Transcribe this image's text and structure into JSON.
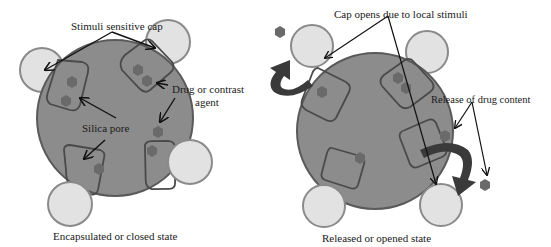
{
  "diagram": {
    "colors": {
      "sphere_fill": "#8c8c8c",
      "sphere_stroke": "#5a5a5a",
      "cap_fill": "#e2e2e2",
      "cap_stroke": "#8a8a8a",
      "pore_stroke": "#4a4a4a",
      "drug_fill": "#6a6a6a",
      "arrow_fill": "#3a3a3a",
      "line": "#111111",
      "background": "#ffffff"
    },
    "left_panel": {
      "caption": "Encapsulated or closed state",
      "labels": {
        "cap": "Stimuli sensitive cap",
        "drug_line1": "Drug or contrast",
        "drug_line2": "agent",
        "pore": "Silica pore"
      }
    },
    "right_panel": {
      "caption": "Released or opened state",
      "labels": {
        "cap_opens": "Cap opens due to local stimuli",
        "release": "Release of drug content"
      }
    }
  }
}
